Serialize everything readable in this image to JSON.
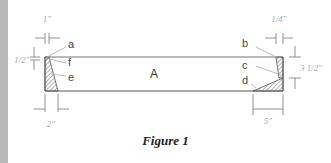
{
  "figure": {
    "caption": "Figure 1",
    "main_label": "A",
    "corner_labels": {
      "a": "a",
      "b": "b",
      "c": "c",
      "d": "d",
      "e": "e",
      "f": "f"
    },
    "dimensions": {
      "top_left_width": "1\"",
      "top_right_width": "1/4\"",
      "left_height": "1/2\"",
      "right_height": "3 1/2\"",
      "bottom_left_width": "2\"",
      "bottom_right_width": "5\""
    },
    "colors": {
      "outline": "#555555",
      "hatch": "#777777",
      "dimension_text": "#aaaaaa",
      "side_stripe": "#b9b9b9"
    }
  }
}
